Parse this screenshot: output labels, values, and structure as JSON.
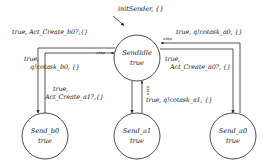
{
  "diagram": {
    "stroke_color": "#2b2b2b",
    "background_color": "#ffffff",
    "text_color": "#1a1a1a",
    "initial_transition": {
      "label": "initSender, {}",
      "target": "SendIdle"
    },
    "states": [
      {
        "id": "send-idle",
        "name": "SendIdle",
        "invariant": "true",
        "cx": 137,
        "cy": 58,
        "r": 23
      },
      {
        "id": "send-b0",
        "name": "Send_b0",
        "invariant": "true",
        "cx": 45,
        "cy": 136,
        "r": 23
      },
      {
        "id": "send-a1",
        "name": "Send_a1",
        "invariant": "true",
        "cx": 137,
        "cy": 136,
        "r": 23
      },
      {
        "id": "send-a0",
        "name": "Send_a0",
        "invariant": "true",
        "cx": 233,
        "cy": 136,
        "r": 23
      }
    ],
    "transitions": [
      {
        "id": "idle-to-b0",
        "from": "SendIdle",
        "to": "Send_b0",
        "guard": "true,",
        "action": "Act_Create_b0?,{}",
        "label": "true, Act_Create_b0?,{}",
        "tag": ""
      },
      {
        "id": "b0-to-idle",
        "from": "Send_b0",
        "to": "SendIdle",
        "guard": "true,",
        "action": "q!cotask_b0, {}",
        "label": "true, q!cotask_b0, {}",
        "tag": "assp"
      },
      {
        "id": "idle-to-a0",
        "from": "SendIdle",
        "to": "Send_a0",
        "guard": "true,",
        "action": "Act_Create_a0?, {}",
        "label": "true, Act_Create_a0?, {}",
        "tag": ""
      },
      {
        "id": "a0-to-idle",
        "from": "Send_a0",
        "to": "SendIdle",
        "guard": "true,",
        "action": "q!cotask_a0, {}",
        "label": "true, q!cotask_a0, {}",
        "tag": "assp"
      },
      {
        "id": "idle-to-a1",
        "from": "SendIdle",
        "to": "Send_a1",
        "guard": "true,",
        "action": "Act_Create_a1?,{}",
        "label": "true, Act_Create_a1?,{}",
        "tag": ""
      },
      {
        "id": "a1-to-idle",
        "from": "Send_a1",
        "to": "SendIdle",
        "guard": "true,",
        "action": "q!cotask_a1, {}",
        "label": "true, q!cotask_a1, {}",
        "tag": "assp"
      }
    ],
    "labels": {
      "init": "initSender, {}",
      "top_left": "true, Act_Create_b0?,{}",
      "top_right": "true, q!cotask_a0, {}",
      "mid_left_line1": "true,",
      "mid_left_line2": "q!cotask_b0, {}",
      "mid_right_line1": "true,",
      "mid_right_line2": "Act_Create_a0?, {}",
      "low_left_line1": "true,",
      "low_left_line2": "Act_Create_a1?,{}",
      "low_center": "true, q!cotask_a1, {}",
      "assp_left": "assp",
      "assp_right": "assp",
      "assp_center": "assp"
    }
  }
}
